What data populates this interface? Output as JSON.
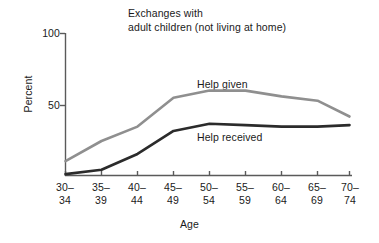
{
  "chart_data": {
    "type": "line",
    "title_line1": "Exchanges with",
    "title_line2": "adult children (not living at home)",
    "xlabel": "Age",
    "ylabel": "Percent",
    "ylim": [
      0,
      100
    ],
    "yticks": [
      50,
      100
    ],
    "ytick_labels": [
      "50",
      "100"
    ],
    "grid": false,
    "legend_position": "inline-annotation",
    "categories": [
      "30–34",
      "35–39",
      "40–44",
      "45–49",
      "50–54",
      "55–59",
      "60–64",
      "65–69",
      "70–74"
    ],
    "category_lines": [
      [
        "30–",
        "34"
      ],
      [
        "35–",
        "39"
      ],
      [
        "40–",
        "44"
      ],
      [
        "45–",
        "49"
      ],
      [
        "50–",
        "54"
      ],
      [
        "55–",
        "59"
      ],
      [
        "60–",
        "64"
      ],
      [
        "65–",
        "69"
      ],
      [
        "70–",
        "74"
      ]
    ],
    "series": [
      {
        "name": "Help given",
        "color": "#8f8f8f",
        "values": [
          11,
          25,
          35,
          55,
          60,
          60,
          56,
          53,
          42
        ]
      },
      {
        "name": "Help received",
        "color": "#2b2b2b",
        "values": [
          2,
          5,
          16,
          32,
          37,
          36,
          35,
          35,
          36
        ]
      }
    ],
    "annotations": [
      {
        "text": "Help given",
        "series": "Help given"
      },
      {
        "text": "Help received",
        "series": "Help received"
      }
    ]
  },
  "axis": {
    "ytick_0_label": "100",
    "ytick_1_label": "50"
  },
  "colors": {
    "help_given": "#8f8f8f",
    "help_received": "#2b2b2b",
    "axis": "#5a5a5a",
    "background": "#ffffff"
  }
}
